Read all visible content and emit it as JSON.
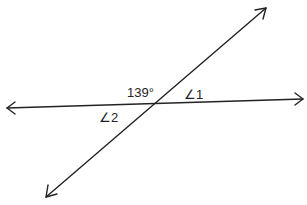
{
  "diagram": {
    "lines": [
      {
        "name": "horizontal-line",
        "from": [
          7,
          108
        ],
        "to": [
          303,
          99
        ]
      },
      {
        "name": "transversal-line",
        "from": [
          46,
          197
        ],
        "to": [
          266,
          8
        ]
      }
    ],
    "intersection": [
      153,
      102
    ],
    "labels": {
      "given_angle": "139°",
      "angle1": "∠1",
      "angle2": "∠2"
    },
    "colors": {
      "stroke": "#222222",
      "background": "#ffffff"
    }
  }
}
